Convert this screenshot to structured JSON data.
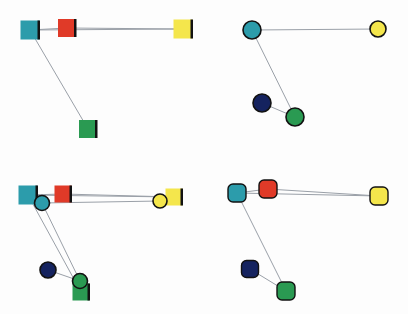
{
  "colors": {
    "teal": "#2c9cab",
    "red": "#e03a28",
    "yellow": "#f4e64c",
    "green": "#2a9a52",
    "navy": "#15235f",
    "edge": "#9aa0a8",
    "outline": "#121212"
  },
  "panels": [
    {
      "id": "top-left",
      "shape": "square",
      "nodes": [
        {
          "name": "teal",
          "x": 30,
          "y": 30,
          "size": 19
        },
        {
          "name": "red",
          "x": 67,
          "y": 28,
          "size": 18
        },
        {
          "name": "yellow",
          "x": 183,
          "y": 29,
          "size": 19
        },
        {
          "name": "green",
          "x": 88,
          "y": 129,
          "size": 18
        }
      ],
      "edges": [
        [
          "teal",
          "red"
        ],
        [
          "red",
          "yellow"
        ],
        [
          "teal",
          "yellow"
        ],
        [
          "teal",
          "green"
        ]
      ]
    },
    {
      "id": "top-right",
      "shape": "circle",
      "nodes": [
        {
          "name": "teal",
          "x": 252,
          "y": 30,
          "size": 18
        },
        {
          "name": "yellow",
          "x": 378,
          "y": 29,
          "size": 16
        },
        {
          "name": "navy",
          "x": 262,
          "y": 103,
          "size": 18
        },
        {
          "name": "green",
          "x": 295,
          "y": 117,
          "size": 18
        }
      ],
      "edges": [
        [
          "teal",
          "yellow"
        ],
        [
          "teal",
          "green"
        ],
        [
          "navy",
          "green"
        ]
      ]
    },
    {
      "id": "bottom-left",
      "shape": "mixed",
      "nodes": [
        {
          "name": "teal",
          "x": 28,
          "y": 195,
          "size": 19,
          "shape": "square"
        },
        {
          "name": "red",
          "x": 63,
          "y": 194,
          "size": 17,
          "shape": "square"
        },
        {
          "name": "yellow",
          "x": 174,
          "y": 197,
          "size": 17,
          "shape": "square"
        },
        {
          "name": "green",
          "x": 81,
          "y": 292,
          "size": 17,
          "shape": "square"
        },
        {
          "name": "teal",
          "x": 42,
          "y": 203,
          "size": 15,
          "shape": "circle"
        },
        {
          "name": "yellow",
          "x": 160,
          "y": 201,
          "size": 14,
          "shape": "circle"
        },
        {
          "name": "navy",
          "x": 48,
          "y": 270,
          "size": 16,
          "shape": "circle"
        },
        {
          "name": "green",
          "x": 80,
          "y": 281,
          "size": 15,
          "shape": "circle"
        }
      ],
      "edges": [
        [
          28,
          195,
          63,
          194
        ],
        [
          63,
          194,
          174,
          197
        ],
        [
          28,
          195,
          174,
          197
        ],
        [
          28,
          195,
          81,
          292
        ],
        [
          42,
          203,
          160,
          201
        ],
        [
          42,
          203,
          80,
          281
        ],
        [
          48,
          270,
          80,
          281
        ]
      ]
    },
    {
      "id": "bottom-right",
      "shape": "rounded-square",
      "nodes": [
        {
          "name": "teal",
          "x": 237,
          "y": 193,
          "size": 18
        },
        {
          "name": "red",
          "x": 268,
          "y": 189,
          "size": 18
        },
        {
          "name": "yellow",
          "x": 379,
          "y": 196,
          "size": 18
        },
        {
          "name": "navy",
          "x": 250,
          "y": 269,
          "size": 17
        },
        {
          "name": "green",
          "x": 286,
          "y": 291,
          "size": 18
        }
      ],
      "edges": [
        [
          "teal",
          "red"
        ],
        [
          "red",
          "yellow"
        ],
        [
          "teal",
          "yellow"
        ],
        [
          "teal",
          "green"
        ],
        [
          "navy",
          "green"
        ]
      ]
    }
  ]
}
